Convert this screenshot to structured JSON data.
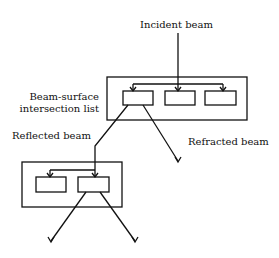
{
  "diagram": {
    "type": "tree-of-intersection-lists",
    "labels": {
      "incident_beam": "Incident beam",
      "list_label_line1": "Beam-surface",
      "list_label_line2": "intersection list",
      "reflected_beam": "Reflected beam",
      "refracted_beam": "Refracted beam"
    },
    "nodes": [
      {
        "id": "list-top",
        "kind": "intersection-list",
        "entries": 3
      },
      {
        "id": "list-reflected",
        "kind": "intersection-list",
        "entries": 2
      }
    ],
    "edges": [
      {
        "from": "incident",
        "to": "list-top.entry-2",
        "label": "Incident beam"
      },
      {
        "from": "list-top.entry-1",
        "to": "list-reflected.entry-2",
        "label": "Reflected beam"
      },
      {
        "from": "list-top.entry-1",
        "to": "out-refracted",
        "label": "Refracted beam"
      },
      {
        "from": "list-reflected.entry-2",
        "to": "out-left",
        "label": ""
      },
      {
        "from": "list-reflected.entry-2",
        "to": "out-right",
        "label": ""
      }
    ],
    "colors": {
      "stroke": "#111111",
      "background": "#ffffff"
    }
  }
}
